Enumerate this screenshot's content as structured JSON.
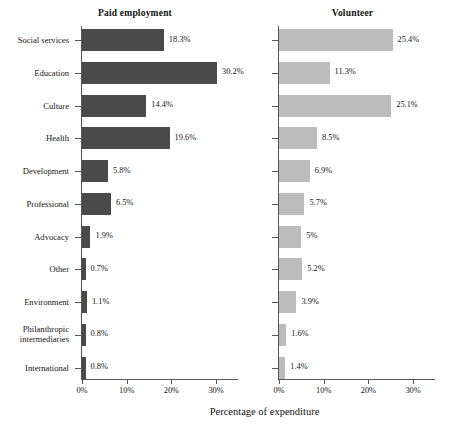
{
  "chart_data": {
    "type": "bar",
    "orientation": "horizontal",
    "title": "",
    "xlabel": "Percentage of expenditure",
    "ylabel": "",
    "xlim": [
      0,
      33
    ],
    "xticks": [
      0,
      10,
      20,
      30
    ],
    "xtick_labels": [
      "0%",
      "10%",
      "20%",
      "30%"
    ],
    "grid": false,
    "legend": "none",
    "panels": [
      "Paid employment",
      "Volunteer"
    ],
    "categories": [
      "Social services",
      "Education",
      "Culture",
      "Health",
      "Development",
      "Professional",
      "Advocacy",
      "Other",
      "Environment",
      "Philanthropic intermediaries",
      "International"
    ],
    "series": [
      {
        "name": "Paid employment",
        "color": "#4a4a4a",
        "values": [
          18.3,
          30.2,
          14.4,
          19.6,
          5.8,
          6.5,
          1.9,
          0.7,
          1.1,
          0.8,
          0.8
        ],
        "labels": [
          "18.3%",
          "30.2%",
          "14.4%",
          "19.6%",
          "5.8%",
          "6.5%",
          "1.9%",
          "0.7%",
          "1.1%",
          "0.8%",
          "0.8%"
        ]
      },
      {
        "name": "Volunteer",
        "color": "#bcbcbc",
        "values": [
          25.4,
          11.3,
          25.1,
          8.5,
          6.9,
          5.7,
          5.0,
          5.2,
          3.9,
          1.6,
          1.4
        ],
        "labels": [
          "25.4%",
          "11.3%",
          "25.1%",
          "8.5%",
          "6.9%",
          "5.7%",
          "5%",
          "5.2%",
          "3.9%",
          "1.6%",
          "1.4%"
        ]
      }
    ]
  },
  "panel_titles": {
    "paid": "Paid employment",
    "volunteer": "Volunteer"
  },
  "axis": {
    "x_title": "Percentage of expenditure"
  }
}
